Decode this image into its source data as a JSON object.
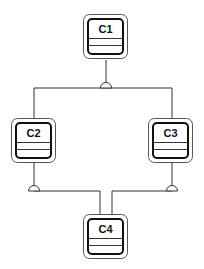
{
  "diagram": {
    "type": "component-diagram",
    "nodes": [
      {
        "id": "c1",
        "label": "C1"
      },
      {
        "id": "c2",
        "label": "C2"
      },
      {
        "id": "c3",
        "label": "C3"
      },
      {
        "id": "c4",
        "label": "C4"
      }
    ],
    "edges": [
      {
        "from": "C1",
        "to": "C2",
        "junction": "semicircle"
      },
      {
        "from": "C1",
        "to": "C3",
        "junction": "semicircle"
      },
      {
        "from": "C2",
        "to": "C4",
        "junction": "semicircle"
      },
      {
        "from": "C3",
        "to": "C4",
        "junction": "semicircle"
      }
    ],
    "colors": {
      "background": "#ffffff",
      "stroke": "#111111",
      "outer_stroke": "#555555"
    }
  }
}
